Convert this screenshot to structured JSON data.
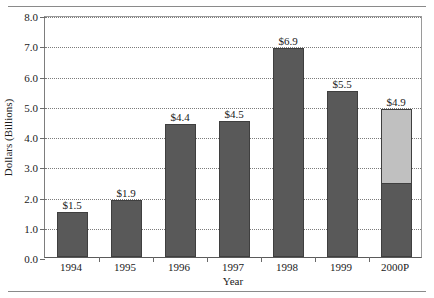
{
  "chart_data": {
    "type": "bar",
    "title": "",
    "subtitle": "",
    "xlabel": "Year",
    "ylabel": "Dollars (Billions)",
    "categories": [
      "1994",
      "1995",
      "1996",
      "1997",
      "1998",
      "1999",
      "2000P"
    ],
    "values": [
      1.5,
      1.9,
      4.4,
      4.5,
      6.9,
      5.5,
      4.9
    ],
    "data_labels": [
      "$1.5",
      "$1.9",
      "$4.4",
      "$4.5",
      "$6.9",
      "$5.5",
      "$4.9"
    ],
    "ylim": [
      0.0,
      8.0
    ],
    "ytick_values": [
      0.0,
      1.0,
      2.0,
      3.0,
      4.0,
      5.0,
      6.0,
      7.0,
      8.0
    ],
    "ytick_labels": [
      "0.0",
      "1.0",
      "2.0",
      "3.0",
      "4.0",
      "5.0",
      "6.0",
      "7.0",
      "8.0"
    ],
    "grid": true,
    "grid_style": "dotted",
    "legend": false,
    "bar_colors": {
      "primary": "#595959",
      "projected": "#c0c0c0",
      "border": "#3f3f3f"
    },
    "stacked_bars": [
      {
        "category": "2000P",
        "segments": [
          {
            "name": "actual",
            "value": 2.4,
            "color": "#595959"
          },
          {
            "name": "projected",
            "value": 2.5,
            "color": "#c0c0c0"
          }
        ],
        "total": 4.9
      }
    ]
  },
  "figure": {
    "rule_color": "#8a8a8a"
  }
}
